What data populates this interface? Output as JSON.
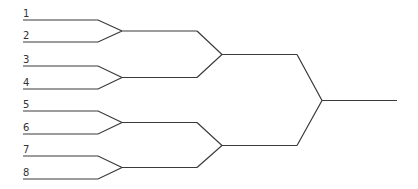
{
  "diagram": {
    "type": "tournament-bracket",
    "line_color": "#3a3a3a",
    "seeds": [
      {
        "label": "1",
        "y": 20
      },
      {
        "label": "2",
        "y": 42
      },
      {
        "label": "3",
        "y": 66
      },
      {
        "label": "4",
        "y": 89
      },
      {
        "label": "5",
        "y": 111
      },
      {
        "label": "6",
        "y": 134
      },
      {
        "label": "7",
        "y": 156
      },
      {
        "label": "8",
        "y": 179
      }
    ],
    "round1_joins": [
      31,
      77.5,
      122.5,
      167.5
    ],
    "round2_joins": [
      54.5,
      145.5
    ],
    "final_join": 100.5
  }
}
